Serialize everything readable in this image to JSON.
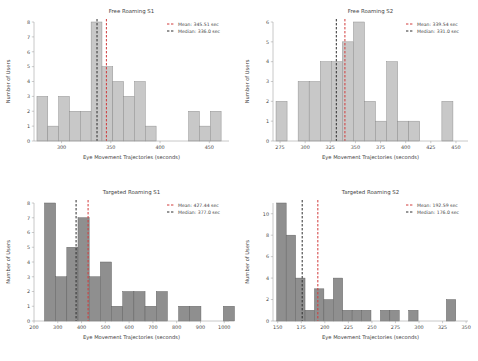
{
  "figure": {
    "background": "#ffffff",
    "axis_color": "#9a9a9a",
    "text_color": "#3f3f3f"
  },
  "panels": [
    {
      "id": "free-roaming-s1",
      "title": "Free Roaming S1",
      "xlabel": "Eye Movement Trajectories (seconds)",
      "ylabel": "Number of Users",
      "bar_color": "#c8c8c8",
      "bar_edge": "#8a8a8a",
      "mean_color": "#d13b3b",
      "median_color": "#2f2f2f",
      "legend": {
        "mean_label": "Mean: 345.51 sec",
        "median_label": "Median: 336.0 sec"
      },
      "chart_data": {
        "type": "bar",
        "title": "Free Roaming S1",
        "xlabel": "Eye Movement Trajectories (seconds)",
        "ylabel": "Number of Users",
        "xlim": [
          272,
          470
        ],
        "ylim": [
          0,
          8
        ],
        "yticks": [
          0,
          1,
          2,
          3,
          4,
          5,
          6,
          7,
          8
        ],
        "xticks": [
          300,
          350,
          400,
          450
        ],
        "grid": false,
        "bin_width": 11,
        "bin_starts": [
          275,
          286,
          297,
          308,
          319,
          330,
          341,
          352,
          363,
          374,
          385,
          396,
          407,
          418,
          429,
          440,
          451
        ],
        "values": [
          3,
          1,
          3,
          2,
          2,
          8,
          5,
          4,
          3,
          4,
          1,
          0,
          0,
          0,
          2,
          1,
          2
        ],
        "mean": 345.51,
        "median": 336.0
      }
    },
    {
      "id": "free-roaming-s2",
      "title": "Free Roaming S2",
      "xlabel": "Eye Movement Trajectories (seconds)",
      "ylabel": "Number of Users",
      "bar_color": "#c8c8c8",
      "bar_edge": "#8a8a8a",
      "mean_color": "#d13b3b",
      "median_color": "#2f2f2f",
      "legend": {
        "mean_label": "Mean: 339.54 sec",
        "median_label": "Median: 331.0 sec"
      },
      "chart_data": {
        "type": "bar",
        "title": "Free Roaming S2",
        "xlabel": "Eye Movement Trajectories (seconds)",
        "ylabel": "Number of Users",
        "xlim": [
          268,
          462
        ],
        "ylim": [
          0,
          6
        ],
        "yticks": [
          0,
          1,
          2,
          3,
          4,
          5,
          6
        ],
        "xticks": [
          275,
          300,
          325,
          350,
          375,
          400,
          425,
          450
        ],
        "grid": false,
        "bin_width": 11,
        "bin_starts": [
          271,
          282,
          293,
          304,
          315,
          326,
          337,
          348,
          359,
          370,
          381,
          392,
          403,
          414,
          425,
          436,
          447
        ],
        "values": [
          2,
          0,
          3,
          3,
          4,
          4,
          5,
          6,
          2,
          1,
          4,
          1,
          1,
          0,
          0,
          2,
          0,
          3
        ],
        "mean": 339.54,
        "median": 331.0
      }
    },
    {
      "id": "targeted-roaming-s1",
      "title": "Targeted Roaming S1",
      "xlabel": "Eye Movement Trajectories (seconds)",
      "ylabel": "Number of Users",
      "bar_color": "#8f8f8f",
      "bar_edge": "#5f5f5f",
      "mean_color": "#d13b3b",
      "median_color": "#2f2f2f",
      "legend": {
        "mean_label": "Mean: 427.44 sec",
        "median_label": "Median: 377.0 sec"
      },
      "chart_data": {
        "type": "bar",
        "title": "Targeted Roaming S1",
        "xlabel": "Eye Movement Trajectories (seconds)",
        "ylabel": "Number of Users",
        "xlim": [
          200,
          1020
        ],
        "ylim": [
          0,
          8
        ],
        "yticks": [
          0,
          1,
          2,
          3,
          4,
          5,
          6,
          7,
          8
        ],
        "xticks": [
          200,
          300,
          400,
          500,
          600,
          700,
          800,
          900,
          1000
        ],
        "grid": false,
        "bin_width": 47,
        "bin_starts": [
          244,
          291,
          338,
          385,
          432,
          479,
          526,
          573,
          620,
          667,
          714,
          761,
          808,
          855,
          902,
          949,
          996
        ],
        "values": [
          8,
          3,
          5,
          7,
          3,
          4,
          1,
          2,
          2,
          1,
          2,
          0,
          1,
          1,
          0,
          0,
          1
        ],
        "mean": 427.44,
        "median": 377.0
      }
    },
    {
      "id": "targeted-roaming-s2",
      "title": "Targeted Roaming S2",
      "xlabel": "Eye Movement Trajectories (seconds)",
      "ylabel": "Number of Users",
      "bar_color": "#8f8f8f",
      "bar_edge": "#5f5f5f",
      "mean_color": "#d13b3b",
      "median_color": "#2f2f2f",
      "legend": {
        "mean_label": "Mean: 192.59 sec",
        "median_label": "Median: 176.0 sec"
      },
      "chart_data": {
        "type": "bar",
        "title": "Targeted Roaming S2",
        "xlabel": "Eye Movement Trajectories (seconds)",
        "ylabel": "Number of Users",
        "xlim": [
          145,
          352
        ],
        "ylim": [
          0,
          11
        ],
        "yticks": [
          0,
          2,
          4,
          6,
          8,
          10
        ],
        "xticks": [
          150,
          175,
          200,
          225,
          250,
          275,
          300,
          325,
          350
        ],
        "grid": false,
        "bin_width": 10,
        "bin_starts": [
          149,
          159,
          169,
          179,
          189,
          199,
          209,
          219,
          229,
          239,
          249,
          259,
          269,
          279,
          289,
          299,
          309,
          319,
          329
        ],
        "values": [
          11,
          8,
          4,
          1,
          3,
          2,
          4,
          1,
          1,
          1,
          0,
          1,
          1,
          0,
          1,
          0,
          0,
          0,
          2
        ],
        "mean": 192.59,
        "median": 176.0
      }
    }
  ]
}
